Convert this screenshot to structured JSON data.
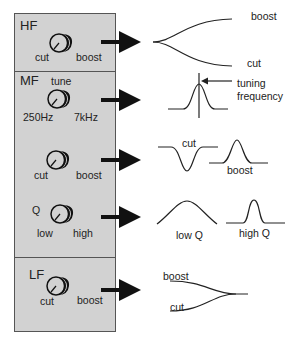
{
  "panel": {
    "background": "#d2d2d2",
    "sections": [
      {
        "band": "HF",
        "knob_labels": {
          "left": "cut",
          "right": "boost"
        }
      },
      {
        "band": "MF",
        "knob_title": "tune",
        "knob_labels": {
          "left": "250Hz",
          "right": "7kHz"
        }
      },
      {
        "band": "",
        "knob_labels": {
          "left": "cut",
          "right": "boost"
        }
      },
      {
        "band": "",
        "knob_title": "Q",
        "knob_labels": {
          "left": "low",
          "right": "high"
        }
      },
      {
        "band": "LF",
        "knob_labels": {
          "left": "cut",
          "right": "boost"
        }
      }
    ]
  },
  "curves": {
    "hf": {
      "top": "boost",
      "bottom": "cut"
    },
    "mf_tune": {
      "annotation_line1": "tuning",
      "annotation_line2": "frequency"
    },
    "mf_gain": {
      "cut": "cut",
      "boost": "boost"
    },
    "mf_q": {
      "low": "low Q",
      "high": "high Q"
    },
    "lf": {
      "top": "boost",
      "bottom": "cut"
    }
  }
}
